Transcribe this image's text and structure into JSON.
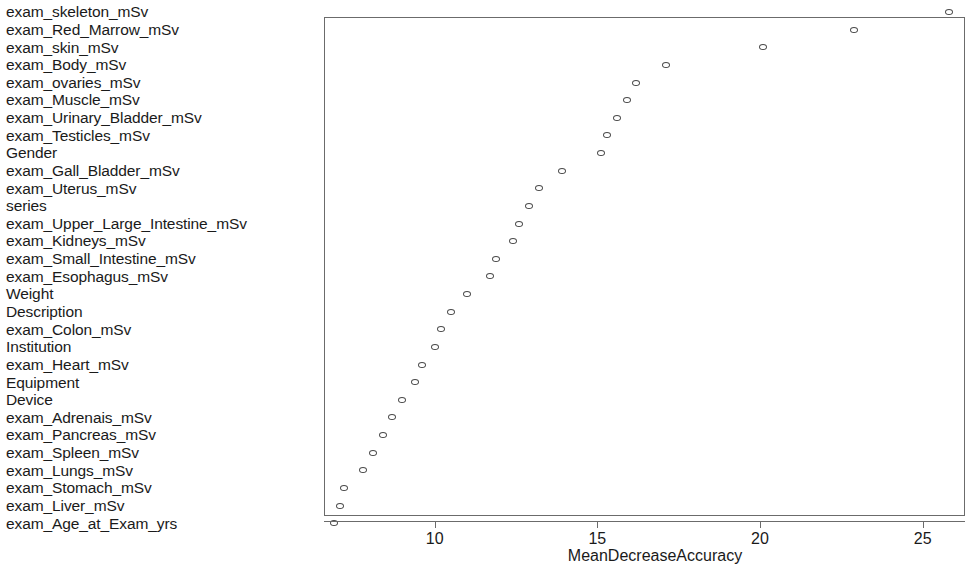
{
  "chart_data": {
    "type": "scatter",
    "title": "",
    "subtitle": "",
    "xlabel": "MeanDecreaseAccuracy",
    "ylabel": "",
    "xlim": [
      6.6,
      26.3
    ],
    "xticks": [
      10,
      15,
      20,
      25
    ],
    "xticklabels": [
      "10",
      "15",
      "20",
      "25"
    ],
    "grid": false,
    "legend": null,
    "orientation": "horizontal-dotchart",
    "marker": "open-circle",
    "marker_color": "#4a4a4a",
    "panel_border": true,
    "categories": [
      "exam_skeleton_mSv",
      "exam_Red_Marrow_mSv",
      "exam_skin_mSv",
      "exam_Body_mSv",
      "exam_ovaries_mSv",
      "exam_Muscle_mSv",
      "exam_Urinary_Bladder_mSv",
      "exam_Testicles_mSv",
      "Gender",
      "exam_Gall_Bladder_mSv",
      "exam_Uterus_mSv",
      "series",
      "exam_Upper_Large_Intestine_mSv",
      "exam_Kidneys_mSv",
      "exam_Small_Intestine_mSv",
      "exam_Esophagus_mSv",
      "Weight",
      "Description",
      "exam_Colon_mSv",
      "Institution",
      "exam_Heart_mSv",
      "Equipment",
      "Device",
      "exam_Adrenais_mSv",
      "exam_Pancreas_mSv",
      "exam_Spleen_mSv",
      "exam_Lungs_mSv",
      "exam_Stomach_mSv",
      "exam_Liver_mSv",
      "exam_Age_at_Exam_yrs"
    ],
    "values": [
      25.8,
      22.9,
      20.1,
      17.1,
      16.2,
      15.9,
      15.6,
      15.3,
      15.1,
      13.9,
      13.2,
      12.9,
      12.6,
      12.4,
      11.9,
      11.7,
      11.0,
      10.5,
      10.2,
      10.0,
      9.6,
      9.4,
      9.0,
      8.7,
      8.4,
      8.1,
      7.8,
      7.2,
      7.1,
      6.9
    ]
  },
  "axis": {
    "xlabel": "MeanDecreaseAccuracy",
    "ticks": [
      {
        "label": "10",
        "value": 10
      },
      {
        "label": "15",
        "value": 15
      },
      {
        "label": "20",
        "value": 20
      },
      {
        "label": "25",
        "value": 25
      }
    ]
  }
}
